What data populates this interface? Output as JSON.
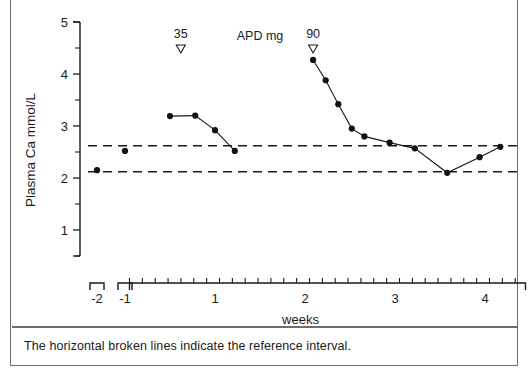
{
  "figure": {
    "caption": "The horizontal broken lines indicate the reference interval."
  },
  "axes": {
    "y_label_line1": "Plasma Ca",
    "y_label_line2": "mmol/L",
    "y_ticks": [
      "5",
      "4",
      "3",
      "2",
      "1"
    ],
    "x_label": "weeks",
    "x_ticks": [
      "-2",
      "-1",
      "1",
      "2",
      "3",
      "4"
    ]
  },
  "annotations": [
    {
      "name": "dose-35",
      "text": "35",
      "marker": "down-triangle",
      "x": 0.62,
      "y": 4.52
    },
    {
      "name": "apd-units",
      "text": "APD mg"
    },
    {
      "name": "dose-90",
      "text": "90",
      "marker": "down-triangle",
      "x": 2.09,
      "y": 4.52
    }
  ],
  "chart_data": {
    "type": "line",
    "title": "",
    "xlabel": "weeks",
    "ylabel": "Plasma Ca   mmol/L",
    "xlim": [
      -2.35,
      4.45
    ],
    "ylim": [
      0.5,
      5.0
    ],
    "grid": false,
    "legend": null,
    "reference_interval": {
      "label": "reference interval",
      "upper": 2.62,
      "lower": 2.12,
      "style": "dashed"
    },
    "series": [
      {
        "name": "Plasma calcium (pre-treatment, broken axis segment)",
        "connected": false,
        "points": [
          {
            "x": -2.0,
            "y": 2.15
          },
          {
            "x": -1.0,
            "y": 2.52
          }
        ]
      },
      {
        "name": "Plasma calcium after APD 35 mg",
        "connected": true,
        "points": [
          {
            "x": 0.5,
            "y": 3.19
          },
          {
            "x": 0.78,
            "y": 3.2
          },
          {
            "x": 1.0,
            "y": 2.92
          },
          {
            "x": 1.22,
            "y": 2.52
          }
        ]
      },
      {
        "name": "Plasma calcium after APD 90 mg",
        "connected": true,
        "points": [
          {
            "x": 2.09,
            "y": 4.27
          },
          {
            "x": 2.23,
            "y": 3.88
          },
          {
            "x": 2.37,
            "y": 3.42
          },
          {
            "x": 2.52,
            "y": 2.95
          },
          {
            "x": 2.66,
            "y": 2.8
          },
          {
            "x": 2.94,
            "y": 2.68
          },
          {
            "x": 3.22,
            "y": 2.57
          },
          {
            "x": 3.58,
            "y": 2.1
          },
          {
            "x": 3.94,
            "y": 2.4
          },
          {
            "x": 4.17,
            "y": 2.6
          }
        ]
      }
    ]
  }
}
